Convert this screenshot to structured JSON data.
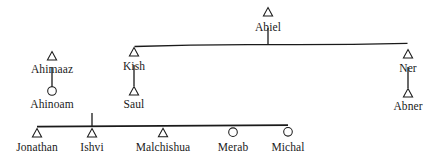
{
  "diagram": {
    "type": "genealogy-kinship",
    "symbols": {
      "male": "triangle",
      "female": "circle"
    },
    "stroke_color": "#1a1a1a",
    "background_color": "#ffffff"
  },
  "persons": {
    "abiel": {
      "label": "Abiel",
      "sex": "male",
      "x": 268,
      "y": 12,
      "label_x": 268,
      "label_y": 22
    },
    "ahimaaz": {
      "label": "Ahimaaz",
      "sex": "male",
      "x": 52,
      "y": 56,
      "label_x": 52,
      "label_y": 64
    },
    "kish": {
      "label": "Kish",
      "sex": "male",
      "x": 134,
      "y": 52,
      "label_x": 134,
      "label_y": 61
    },
    "ner": {
      "label": "Ner",
      "sex": "male",
      "x": 408,
      "y": 54,
      "label_x": 408,
      "label_y": 63
    },
    "ahinoam": {
      "label": "Ahinoam",
      "sex": "female",
      "x": 52,
      "y": 92,
      "label_x": 52,
      "label_y": 99
    },
    "saul": {
      "label": "Saul",
      "sex": "male",
      "x": 134,
      "y": 92,
      "label_x": 134,
      "label_y": 99
    },
    "abner": {
      "label": "Abner",
      "sex": "male",
      "x": 408,
      "y": 93,
      "label_x": 408,
      "label_y": 101
    },
    "jonathan": {
      "label": "Jonathan",
      "sex": "male",
      "x": 37,
      "y": 133,
      "label_x": 37,
      "label_y": 142
    },
    "ishvi": {
      "label": "Ishvi",
      "sex": "male",
      "x": 92,
      "y": 133,
      "label_x": 92,
      "label_y": 142
    },
    "malchishua": {
      "label": "Malchishua",
      "sex": "male",
      "x": 163,
      "y": 133,
      "label_x": 163,
      "label_y": 142
    },
    "merab": {
      "label": "Merab",
      "sex": "female",
      "x": 233,
      "y": 133,
      "label_x": 233,
      "label_y": 142
    },
    "michal": {
      "label": "Michal",
      "sex": "female",
      "x": 288,
      "y": 133,
      "label_x": 288,
      "label_y": 142
    }
  },
  "links": {
    "abiel_stem": {
      "from": "abiel",
      "to": "sibling-bar-top"
    },
    "top_sibling_bar": {
      "left": "kish",
      "right": "ner"
    },
    "ahimaaz_ahinoam": {
      "from": "ahimaaz",
      "to": "ahinoam"
    },
    "kish_saul": {
      "from": "kish",
      "to": "saul"
    },
    "ner_abner": {
      "from": "ner",
      "to": "abner"
    },
    "saul_children_stem": {
      "from": "saul",
      "to": "children-bar"
    },
    "children_bar": {
      "left": "jonathan",
      "right": "michal"
    }
  }
}
